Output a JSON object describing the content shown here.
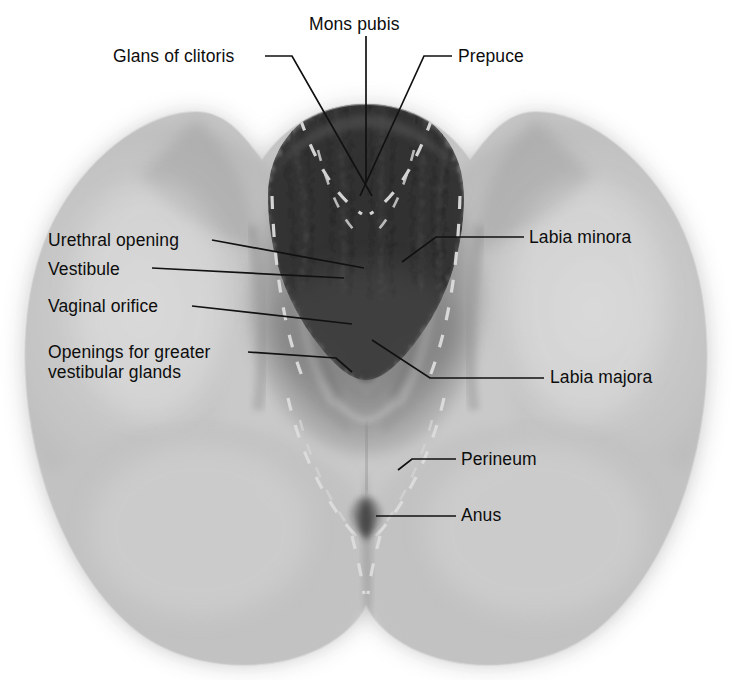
{
  "figure": {
    "kind": "anatomical-illustration",
    "width": 732,
    "height": 680,
    "background_color": "#ffffff",
    "text_color": "#0d0d0d",
    "leader_line_color": "#141414",
    "dashed_guide_color": "#d8d8d8",
    "outline_color": "#f2f2f2",
    "skin_tone_light": "#e8e8e8",
    "skin_tone_mid": "#b9b9b9",
    "skin_tone_dark": "#8a8a8a",
    "hair_color": "#3a3a3a",
    "orifice_color": "#101010"
  },
  "labels": [
    {
      "id": "mons-pubis",
      "text": "Mons pubis",
      "x": 309,
      "y": 14,
      "align": "left",
      "leader": "vertical from text down to mons pubis"
    },
    {
      "id": "glans-of-clitoris",
      "text": "Glans of clitoris",
      "x": 113,
      "y": 46,
      "align": "left",
      "leader": "horizontal then diagonal down-right to clitoris"
    },
    {
      "id": "prepuce",
      "text": "Prepuce",
      "x": 458,
      "y": 46,
      "align": "left",
      "leader": "horizontal then diagonal down-left to prepuce"
    },
    {
      "id": "urethral-opening",
      "text": "Urethral opening",
      "x": 48,
      "y": 230,
      "align": "left",
      "leader": "horizontal right to urethral meatus"
    },
    {
      "id": "labia-minora",
      "text": "Labia minora",
      "x": 529,
      "y": 227,
      "align": "left",
      "leader": "horizontal left then diagonal down-left to labium minus"
    },
    {
      "id": "vestibule",
      "text": "Vestibule",
      "x": 48,
      "y": 259,
      "align": "left",
      "leader": "horizontal right to vestibule"
    },
    {
      "id": "vaginal-orifice",
      "text": "Vaginal orifice",
      "x": 48,
      "y": 296,
      "align": "left",
      "leader": "horizontal right to vaginal orifice"
    },
    {
      "id": "openings-for-greater-vestibular-glands",
      "text": "Openings for greater\nvestibular glands",
      "x": 48,
      "y": 342,
      "align": "left",
      "leader": "horizontal right then short diagonal to gland openings"
    },
    {
      "id": "labia-majora",
      "text": "Labia majora",
      "x": 550,
      "y": 367,
      "align": "left",
      "leader": "horizontal left then diagonal up-left to labium majus"
    },
    {
      "id": "perineum",
      "text": "Perineum",
      "x": 461,
      "y": 449,
      "align": "left",
      "leader": "horizontal left then short diagonal down-left to perineum"
    },
    {
      "id": "anus",
      "text": "Anus",
      "x": 461,
      "y": 505,
      "align": "left",
      "leader": "horizontal left to anus"
    }
  ],
  "structures": [
    {
      "id": "mons-pubis-region",
      "name": "Mons pubis"
    },
    {
      "id": "pubic-hair",
      "name": "Pubic hair"
    },
    {
      "id": "clitoris-glans",
      "name": "Glans of clitoris"
    },
    {
      "id": "prepuce-fold",
      "name": "Prepuce"
    },
    {
      "id": "labium-majus-left",
      "name": "Left labium majus"
    },
    {
      "id": "labium-majus-right",
      "name": "Right labium majus"
    },
    {
      "id": "labium-minus-left",
      "name": "Left labium minus"
    },
    {
      "id": "labium-minus-right",
      "name": "Right labium minus"
    },
    {
      "id": "vestibule-outline",
      "name": "Vestibule"
    },
    {
      "id": "urethral-meatus",
      "name": "Urethral opening"
    },
    {
      "id": "vaginal-orifice-opening",
      "name": "Vaginal orifice"
    },
    {
      "id": "greater-vestibular-gland-openings",
      "name": "Openings for greater vestibular glands"
    },
    {
      "id": "perineum-region",
      "name": "Perineum"
    },
    {
      "id": "anus-opening",
      "name": "Anus"
    },
    {
      "id": "thigh-left",
      "name": "Left thigh"
    },
    {
      "id": "thigh-right",
      "name": "Right thigh"
    },
    {
      "id": "buttock-left",
      "name": "Left buttock"
    },
    {
      "id": "buttock-right",
      "name": "Right buttock"
    }
  ]
}
